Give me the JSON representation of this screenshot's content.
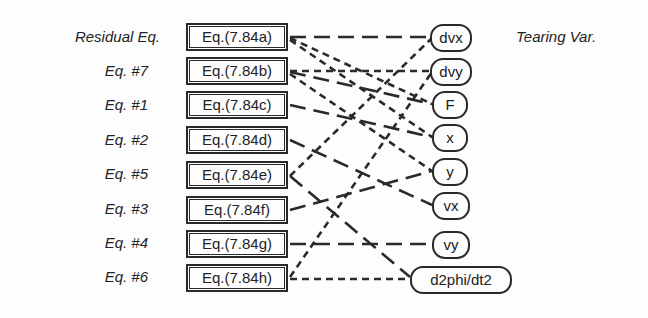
{
  "headers": {
    "left": "Residual Eq.",
    "right": "Tearing Var."
  },
  "equations": [
    {
      "id": "a",
      "row_label": "Residual Eq.",
      "box": "Eq.(7.84a)"
    },
    {
      "id": "b",
      "row_label": "Eq. #7",
      "box": "Eq.(7.84b)"
    },
    {
      "id": "c",
      "row_label": "Eq. #1",
      "box": "Eq.(7.84c)"
    },
    {
      "id": "d",
      "row_label": "Eq. #2",
      "box": "Eq.(7.84d)"
    },
    {
      "id": "e",
      "row_label": "Eq. #5",
      "box": "Eq.(7.84e)"
    },
    {
      "id": "f",
      "row_label": "Eq. #3",
      "box": "Eq.(7.84f)"
    },
    {
      "id": "g",
      "row_label": "Eq. #4",
      "box": "Eq.(7.84g)"
    },
    {
      "id": "h",
      "row_label": "Eq. #6",
      "box": "Eq.(7.84h)"
    }
  ],
  "variables": [
    "dvx",
    "dvy",
    "F",
    "x",
    "y",
    "vx",
    "vy",
    "d2phi/dt2"
  ],
  "edges": [
    {
      "from": "Eq.(7.84a)",
      "to": "dvx",
      "style": "long-dash"
    },
    {
      "from": "Eq.(7.84a)",
      "to": "F",
      "style": "dash"
    },
    {
      "from": "Eq.(7.84a)",
      "to": "x",
      "style": "dash"
    },
    {
      "from": "Eq.(7.84b)",
      "to": "dvy",
      "style": "dash"
    },
    {
      "from": "Eq.(7.84b)",
      "to": "F",
      "style": "long-dash"
    },
    {
      "from": "Eq.(7.84b)",
      "to": "y",
      "style": "dash"
    },
    {
      "from": "Eq.(7.84c)",
      "to": "x",
      "style": "long-dash"
    },
    {
      "from": "Eq.(7.84d)",
      "to": "vx",
      "style": "long-dash"
    },
    {
      "from": "Eq.(7.84e)",
      "to": "dvx",
      "style": "dash"
    },
    {
      "from": "Eq.(7.84e)",
      "to": "d2phi/dt2",
      "style": "long-dash"
    },
    {
      "from": "Eq.(7.84f)",
      "to": "y",
      "style": "long-dash"
    },
    {
      "from": "Eq.(7.84g)",
      "to": "vy",
      "style": "long-dash"
    },
    {
      "from": "Eq.(7.84h)",
      "to": "dvy",
      "style": "dash"
    },
    {
      "from": "Eq.(7.84h)",
      "to": "d2phi/dt2",
      "style": "dash"
    }
  ]
}
